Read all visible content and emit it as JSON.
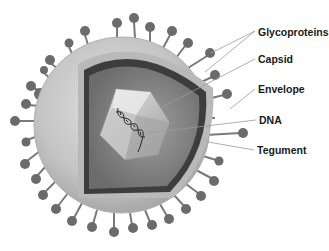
{
  "diagram": {
    "background": "#ffffff",
    "colors": {
      "envelope": "#c8c8c8",
      "envelope_cut": "#a9a9a9",
      "tegument": "#8a8a8a",
      "inner_membrane": "#3a3a3a",
      "capsid": "#d6d6d6",
      "glycoprotein": "#6e6e6e",
      "leader_line": "#9a9a9a",
      "label_text": "#1a1a1a"
    },
    "labels": [
      {
        "text": "Glycoproteins",
        "x": 258,
        "y": 26
      },
      {
        "text": "Capsid",
        "x": 258,
        "y": 53
      },
      {
        "text": "Envelope",
        "x": 258,
        "y": 83
      },
      {
        "text": "DNA",
        "x": 259,
        "y": 114
      },
      {
        "text": "Tegument",
        "x": 257,
        "y": 144
      }
    ]
  }
}
